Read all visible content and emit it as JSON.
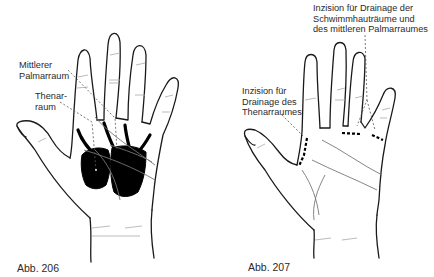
{
  "figures": [
    {
      "id": "abb-206",
      "caption": "Abb. 206",
      "labels": {
        "mittlerer_palmarraum": "Mittlerer\nPalmarraum",
        "thenarraum": "Thenar-\nraum"
      }
    },
    {
      "id": "abb-207",
      "caption": "Abb. 207",
      "labels": {
        "schwimmhaut": "Inzision für Drainage der\nSchwimmhauträume und\ndes mittleren Palmarraumes",
        "thenar_inzision": "Inzision für\nDrainage des\nThenarraumes"
      }
    }
  ],
  "colors": {
    "ink": "#1a1a1a",
    "shading": "#000000",
    "leader": "#555555",
    "background": "#ffffff"
  }
}
